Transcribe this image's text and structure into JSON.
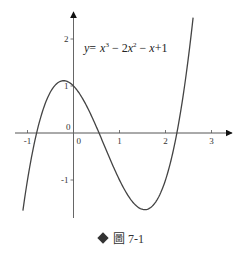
{
  "chart_data": {
    "type": "line",
    "title": "",
    "equation": "y = x^3 - 2x^2 - x + 1",
    "xlabel": "",
    "ylabel": "",
    "xlim": [
      -1.1,
      3.3
    ],
    "ylim": [
      -1.9,
      2.6
    ],
    "x_ticks": [
      -1,
      1,
      2,
      3
    ],
    "y_ticks": [
      2,
      1,
      -1
    ],
    "origin_labels": [
      "0",
      "0"
    ],
    "grid": false,
    "series": [
      {
        "name": "y = x^3 - 2x^2 - x + 1",
        "x": [
          -1.1,
          -1.0,
          -0.8,
          -0.6,
          -0.4,
          -0.2,
          0.0,
          0.2,
          0.4,
          0.6,
          0.8,
          1.0,
          1.2,
          1.4,
          1.53,
          1.6,
          1.8,
          2.0,
          2.2,
          2.4,
          2.6
        ],
        "y": [
          -1.82,
          -1.0,
          0.01,
          0.66,
          1.02,
          1.11,
          1.0,
          0.73,
          0.34,
          -0.11,
          -0.57,
          -1.0,
          -1.35,
          -1.58,
          -1.63,
          -1.62,
          -1.44,
          -1.0,
          -0.27,
          0.82,
          2.34
        ]
      }
    ]
  },
  "equation_label": {
    "y": "y",
    "eq": "=",
    "x1": "x",
    "sup1": "3",
    "minus1": " − 2",
    "x2": "x",
    "sup2": "2",
    "minus2": " − ",
    "x3": "x",
    "plus": "+1"
  },
  "caption": {
    "text": "圖 7-1"
  }
}
